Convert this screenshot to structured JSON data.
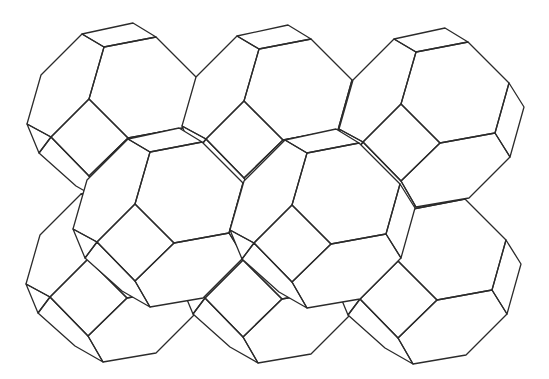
{
  "figure": {
    "width": 549,
    "height": 379,
    "background": "#ffffff",
    "stroke_color": "#2b2b2b"
  },
  "template": {
    "vertices": {
      "h0": [
        0,
        0
      ],
      "h1": [
        52,
        -10
      ],
      "h2": [
        93,
        31
      ],
      "h3": [
        79,
        81
      ],
      "h4": [
        24,
        91
      ],
      "h5": [
        -15,
        52
      ],
      "t0": [
        -22,
        -13
      ],
      "t1": [
        29,
        -24
      ],
      "L1": [
        -63,
        28
      ],
      "L2": [
        -77,
        77
      ],
      "sqb": [
        -15,
        129
      ],
      "sql": [
        -53,
        90
      ],
      "r1": [
        108,
        55
      ],
      "r2": [
        94,
        105
      ],
      "b1": [
        53,
        146
      ],
      "b2": [
        0,
        155
      ],
      "ll1": [
        -65,
        106
      ],
      "ll2": [
        -28,
        139
      ]
    },
    "silhouette": [
      "t0",
      "t1",
      "h1",
      "h2",
      "r1",
      "r2",
      "b1",
      "b2",
      "ll2",
      "ll1",
      "L2",
      "L1"
    ],
    "faces": [
      {
        "name": "front-hexagon",
        "verts": [
          "h0",
          "h1",
          "h2",
          "h3",
          "h4",
          "h5"
        ]
      },
      {
        "name": "top-square",
        "verts": [
          "t0",
          "t1",
          "h1",
          "h0"
        ]
      },
      {
        "name": "left-hexagon",
        "verts": [
          "t0",
          "h0",
          "h5",
          "sql",
          "L2",
          "L1"
        ]
      },
      {
        "name": "front-square",
        "verts": [
          "h5",
          "h4",
          "sqb",
          "sql"
        ]
      },
      {
        "name": "right-square",
        "verts": [
          "h2",
          "r1",
          "r2",
          "h3"
        ]
      },
      {
        "name": "bottom-hexagon",
        "verts": [
          "h4",
          "h3",
          "r2",
          "b1",
          "b2",
          "sqb"
        ]
      },
      {
        "name": "lower-left-square",
        "verts": [
          "sql",
          "sqb",
          "b2",
          "ll2",
          "ll1"
        ]
      },
      {
        "name": "left-strip",
        "verts": [
          "L2",
          "sql",
          "ll1"
        ]
      }
    ]
  },
  "units": [
    {
      "id": "G",
      "row": "bottom",
      "anchor": [
        103,
        207
      ]
    },
    {
      "id": "H",
      "row": "bottom",
      "anchor": [
        258,
        208
      ]
    },
    {
      "id": "F",
      "row": "bottom",
      "anchor": [
        413,
        209
      ]
    },
    {
      "id": "A",
      "row": "top",
      "anchor": [
        104,
        47
      ]
    },
    {
      "id": "B",
      "row": "top",
      "anchor": [
        259,
        49
      ]
    },
    {
      "id": "C",
      "row": "top",
      "anchor": [
        416,
        52
      ]
    },
    {
      "id": "D",
      "row": "middle",
      "anchor": [
        150,
        152
      ]
    },
    {
      "id": "E",
      "row": "middle",
      "anchor": [
        307,
        153
      ]
    }
  ]
}
